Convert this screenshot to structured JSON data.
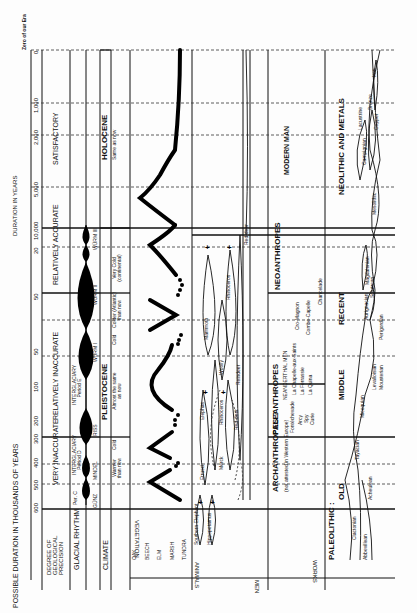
{
  "axis": {
    "title_thousands": "POSSIBLE DURATION IN THOUSANDS OF YEARS",
    "title_years": "DURATION IN YEARS",
    "zero_label": "Zero of our Era",
    "ticks_thousands": [
      "600",
      "500",
      "400",
      "300",
      "200",
      "100",
      "50",
      "50",
      "20"
    ],
    "ticks_years": [
      "10,000",
      "5,000",
      "2,000",
      "1,000",
      "0"
    ]
  },
  "rows": {
    "precision": "DEGREE OF GEOLOGICAL PRECISION",
    "glacial": "GLACIAL RHYTHM",
    "climate": "CLIMATE",
    "vegetation": "VEGETATION",
    "animals": "ANIMALS",
    "men": "MEN",
    "works": "WORKS"
  },
  "precision": {
    "very_inaccurate": "VERY INACCURATE",
    "relatively_inaccurate": "RELATIVELY INACCURATE",
    "relatively_accurate": "RELATIVELY ACCURATE",
    "satisfactory": "SATISFACTORY"
  },
  "glacial": {
    "gunz": "GÜNZ",
    "mindel": "MINDEL",
    "riss": "RISS",
    "wurm1": "WÜRM I",
    "wurm2": "WÜRM II",
    "wurm3": "WÜRM III",
    "per_c": "Per. C",
    "interglaciary_d": "INTERGLACIARY Period D",
    "interglaciary_e": "INTERGLACIARY Period E"
  },
  "epochs": {
    "pleistocene": "PLEISTOCENE",
    "holocene": "HOLOCENE"
  },
  "climate": {
    "warmer": "Warmer than now",
    "cold": "Cold",
    "almost_same": "Almost the same as now",
    "cold2": "Cold",
    "colder": "Colder (Atlantic) than now",
    "very_cold": "Very Cold (continental)",
    "same": "Same as now"
  },
  "vegetation": {
    "items": [
      "OAK",
      "BEECH",
      "ELM",
      "MARSH",
      "TUNDRA"
    ]
  },
  "animals": {
    "southern_elephant": "Southern Elephant",
    "hippopotamus": "Hippopotamus",
    "elephas": "Elephas",
    "etrusci": "Etrusci",
    "rhinoceros_merck": "Rhinoceros",
    "merck": "Merck",
    "mammoth": "Mammoth",
    "woolly": "Woolly",
    "rhinoceros": "Rhinoceros",
    "red_deer": "Red-deer",
    "red_deer2": "Red-deer",
    "reindeer": "Reindeer"
  },
  "men": {
    "archanthropes": "ARCHANTHROPES ?",
    "archanthropes_note": "(not attested in Western Europe)",
    "paleanthropes": "PALEANTHROPES",
    "neanderthal": "NEANDERTHAL MEN",
    "fontechevade": "Fontéchevade",
    "arcy": "Arcy",
    "spy": "Spy",
    "curie": "Curie",
    "chapelle": "La Chapelle-aux-Saints",
    "ferrassie": "La Ferrassie",
    "quina": "La Quina",
    "neoanthropes": "NEOANTHROPES",
    "cromagnon": "Cro-Magnon",
    "combe": "Combe-Capelle",
    "chancelade": "Chancelade",
    "modern": "MODERN MAN"
  },
  "works": {
    "paleolithic": "PALEOLITHIC :",
    "old": "OLD",
    "middle": "MIDDLE",
    "recent": "RECENT",
    "neolithic_metals": "NEOLITHIC AND METALS",
    "clactonian": "Clactonian",
    "abbevillean": "Abbevillean",
    "acheulean": "Acheulean",
    "tayacian": "Tayacian",
    "micoquian": "Micoquian",
    "levalloisian": "Levalloisian",
    "mousterian": "Mousterian",
    "aurignacian": "Aurignacian",
    "perigordian": "Perigordian",
    "solutrean": "Solutrean",
    "magdalenian": "Magdalenian",
    "mesolithic": "Mesolithic",
    "campignian": "Campignian",
    "lacustrine": "Lacustrine",
    "copper": "Copper",
    "bronze": "Bronze",
    "iron": "Iron"
  }
}
